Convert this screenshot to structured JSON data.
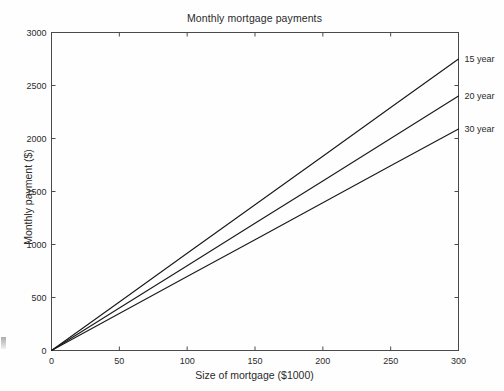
{
  "chart_data": {
    "type": "line",
    "title": "Monthly mortgage payments",
    "xlabel": "Size of mortgage ($1000)",
    "ylabel": "Monthly payment ($)",
    "xlim": [
      0,
      300
    ],
    "ylim": [
      0,
      3000
    ],
    "xticks": [
      0,
      50,
      100,
      150,
      200,
      250,
      300
    ],
    "xtick_labels": [
      "0",
      "50",
      "100",
      "150",
      "200",
      "250",
      "300"
    ],
    "yticks": [
      0,
      500,
      1000,
      1500,
      2000,
      2500,
      3000
    ],
    "ytick_labels": [
      "0",
      "500",
      "1000",
      "1500",
      "2000",
      "2500",
      "3000"
    ],
    "grid": false,
    "legend_position": "right-of-axes-inline-labels",
    "x": [
      0,
      50,
      100,
      150,
      200,
      250,
      300
    ],
    "series": [
      {
        "name": "15 year",
        "label": "15 year",
        "color": "#1a1a1a",
        "values": [
          0,
          458,
          917,
          1375,
          1833,
          2292,
          2750
        ]
      },
      {
        "name": "20 year",
        "label": "20 year",
        "color": "#1a1a1a",
        "values": [
          0,
          400,
          800,
          1200,
          1600,
          2000,
          2400
        ]
      },
      {
        "name": "30 year",
        "label": "30 year",
        "color": "#1a1a1a",
        "values": [
          0,
          348,
          697,
          1045,
          1393,
          1742,
          2090
        ]
      }
    ]
  },
  "figure": {
    "background_color": "#fefefe",
    "axis_color": "#4a4a4a",
    "line_color": "#1a1a1a"
  }
}
